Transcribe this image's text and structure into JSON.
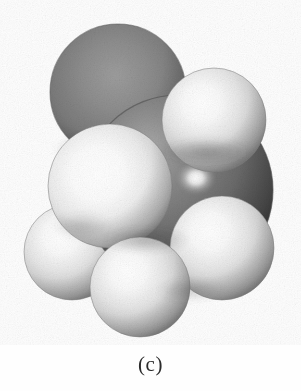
{
  "figure": {
    "kind": "space-filling-molecular-model",
    "caption": "(c)",
    "background_color": "#fefefe",
    "ink_color": "#2b2b2b",
    "rendering": "grayscale halftone print scan",
    "canvas": {
      "width": 301,
      "height": 391
    },
    "model_area": {
      "x": 30,
      "y": 25,
      "width": 242,
      "height": 312
    }
  },
  "palette": {
    "carbon_base": "#6e6e6e",
    "carbon_dark": "#4a4a4a",
    "carbon_shadow": "#3a3a3a",
    "carbon_highlight": "#b9b9b9",
    "hydrogen_base": "#e9e9e9",
    "hydrogen_dark": "#a9a9a9",
    "hydrogen_shadow": "#8c8c8c",
    "hydrogen_highlight": "#ffffff",
    "outline": "#5a5a5a"
  },
  "model": {
    "description": "space-filling model of a small hydrocarbon molecule viewed at an angle",
    "light_direction": "upper-left",
    "atoms": [
      {
        "id": "C1",
        "element": "carbon",
        "label": "carbon-top",
        "cx": 118,
        "cy": 92,
        "r": 68,
        "z": 1,
        "shade": "carbon",
        "highlight": {
          "x": "46%",
          "y": "40%",
          "intensity": 0.3
        }
      },
      {
        "id": "H1",
        "element": "hydrogen",
        "label": "hydrogen-left-lower",
        "cx": 72,
        "cy": 252,
        "r": 48,
        "z": 2,
        "shade": "hydrogen",
        "highlight": {
          "x": "38%",
          "y": "32%",
          "intensity": 0.88
        }
      },
      {
        "id": "C2",
        "element": "carbon",
        "label": "carbon-front-right",
        "cx": 178,
        "cy": 190,
        "r": 95,
        "z": 3,
        "shade": "carbon",
        "highlight": {
          "x": "22%",
          "y": "21%",
          "intensity": 0.92
        }
      },
      {
        "id": "H2",
        "element": "hydrogen",
        "label": "hydrogen-upper-right",
        "cx": 214,
        "cy": 120,
        "r": 52,
        "z": 4,
        "shade": "hydrogen",
        "highlight": {
          "x": "36%",
          "y": "34%",
          "intensity": 0.9
        }
      },
      {
        "id": "H3",
        "element": "hydrogen",
        "label": "hydrogen-right-lower",
        "cx": 222,
        "cy": 248,
        "r": 52,
        "z": 5,
        "shade": "hydrogen",
        "highlight": {
          "x": "30%",
          "y": "30%",
          "intensity": 0.9
        }
      },
      {
        "id": "H4",
        "element": "hydrogen",
        "label": "hydrogen-center-front",
        "cx": 110,
        "cy": 186,
        "r": 62,
        "z": 6,
        "shade": "hydrogen",
        "highlight": {
          "x": "40%",
          "y": "40%",
          "intensity": 1.0
        }
      },
      {
        "id": "H5",
        "element": "hydrogen",
        "label": "hydrogen-bottom-center",
        "cx": 140,
        "cy": 287,
        "r": 50,
        "z": 7,
        "shade": "hydrogen",
        "highlight": {
          "x": "40%",
          "y": "34%",
          "intensity": 0.92
        }
      }
    ]
  }
}
